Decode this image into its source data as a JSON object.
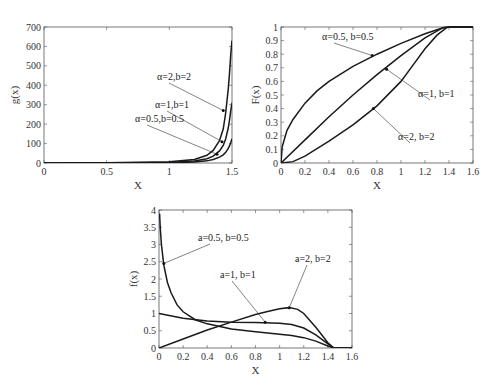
{
  "chart_data": [
    {
      "id": "g",
      "type": "line",
      "title": "",
      "xlabel": "X",
      "ylabel": "g(x)",
      "xlim": [
        0,
        1.5
      ],
      "ylim": [
        0,
        700
      ],
      "xticks": [
        0,
        0.5,
        1,
        1.5
      ],
      "xtick_labels": [
        "0",
        "0.5",
        "1",
        "1.5"
      ],
      "yticks": [
        0,
        100,
        200,
        300,
        400,
        500,
        600,
        700
      ],
      "ytick_labels": [
        "0",
        "100",
        "200",
        "300",
        "400",
        "500",
        "600",
        "700"
      ],
      "grid": false,
      "box": {
        "left": 44,
        "top": 27,
        "right": 232,
        "bottom": 163
      },
      "series": [
        {
          "name": "α=2,b=2",
          "x": [
            0,
            0.5,
            1.0,
            1.2,
            1.3,
            1.35,
            1.4,
            1.43,
            1.45,
            1.47,
            1.48,
            1.49,
            1.5
          ],
          "y": [
            0,
            1,
            6,
            18,
            40,
            65,
            115,
            175,
            260,
            380,
            460,
            560,
            630
          ]
        },
        {
          "name": "α=1,b=1",
          "x": [
            0,
            0.5,
            1.0,
            1.2,
            1.3,
            1.35,
            1.4,
            1.43,
            1.45,
            1.47,
            1.48,
            1.49,
            1.5
          ],
          "y": [
            0,
            0.5,
            3,
            10,
            22,
            35,
            62,
            90,
            125,
            180,
            220,
            270,
            310
          ]
        },
        {
          "name": "α=0.5,b=0.5",
          "x": [
            0,
            0.5,
            1.0,
            1.2,
            1.3,
            1.35,
            1.4,
            1.43,
            1.45,
            1.47,
            1.48,
            1.49,
            1.5
          ],
          "y": [
            0,
            0.2,
            1.5,
            5,
            11,
            18,
            30,
            42,
            55,
            75,
            88,
            105,
            125
          ]
        }
      ],
      "annotations": [
        {
          "text": "α=2,b=2",
          "x": 1.43,
          "y": 270,
          "tx": 157,
          "ty": 80
        },
        {
          "text": "α=1,b=1",
          "x": 1.42,
          "y": 110,
          "tx": 155,
          "ty": 108
        },
        {
          "text": "α=0.5,b=0.5",
          "x": 1.38,
          "y": 45,
          "tx": 135,
          "ty": 122
        }
      ]
    },
    {
      "id": "F",
      "type": "line",
      "title": "",
      "xlabel": "X",
      "ylabel": "F(x)",
      "xlim": [
        0,
        1.6
      ],
      "ylim": [
        0,
        1
      ],
      "xticks": [
        0,
        0.2,
        0.4,
        0.6,
        0.8,
        1,
        1.2,
        1.4,
        1.6
      ],
      "xtick_labels": [
        "0",
        "0.2",
        "0.4",
        "0.6",
        "0.8",
        "1",
        "1.2",
        "1.4",
        "1.6"
      ],
      "yticks": [
        0,
        0.1,
        0.2,
        0.3,
        0.4,
        0.5,
        0.6,
        0.7,
        0.8,
        0.9,
        1
      ],
      "ytick_labels": [
        "0",
        "0.1",
        "0.2",
        "0.3",
        "0.4",
        "0.5",
        "0.6",
        "0.7",
        "0.8",
        "0.9",
        "1"
      ],
      "grid": false,
      "box": {
        "left": 281,
        "top": 27,
        "right": 473,
        "bottom": 163
      },
      "series": [
        {
          "name": "α=0.5, b=0.5",
          "x": [
            0,
            0.01,
            0.05,
            0.1,
            0.2,
            0.3,
            0.4,
            0.6,
            0.8,
            1.0,
            1.2,
            1.35,
            1.4,
            1.6
          ],
          "y": [
            0,
            0.12,
            0.24,
            0.32,
            0.44,
            0.53,
            0.6,
            0.71,
            0.8,
            0.88,
            0.95,
            0.995,
            1,
            1
          ]
        },
        {
          "name": "α=1, b=1",
          "x": [
            0,
            0.2,
            0.4,
            0.6,
            0.8,
            1.0,
            1.2,
            1.35,
            1.4,
            1.6
          ],
          "y": [
            0,
            0.17,
            0.34,
            0.5,
            0.65,
            0.79,
            0.92,
            0.995,
            1,
            1
          ]
        },
        {
          "name": "α=2, b=2",
          "x": [
            0,
            0.1,
            0.2,
            0.4,
            0.6,
            0.8,
            1.0,
            1.1,
            1.2,
            1.3,
            1.38,
            1.4,
            1.6
          ],
          "y": [
            0,
            0.01,
            0.05,
            0.16,
            0.28,
            0.42,
            0.6,
            0.72,
            0.84,
            0.94,
            0.995,
            1,
            1
          ]
        }
      ],
      "annotations": [
        {
          "text": "α=0.5, b=0.5",
          "x": 0.76,
          "y": 0.79,
          "tx": 322,
          "ty": 40
        },
        {
          "text": "α=1, b=1",
          "x": 0.88,
          "y": 0.69,
          "tx": 418,
          "ty": 97
        },
        {
          "text": "α=2, b=2",
          "x": 0.77,
          "y": 0.4,
          "tx": 398,
          "ty": 140
        }
      ]
    },
    {
      "id": "f",
      "type": "line",
      "title": "",
      "xlabel": "X",
      "ylabel": "f(x)",
      "xlim": [
        0,
        1.6
      ],
      "ylim": [
        0,
        4
      ],
      "xticks": [
        0,
        0.2,
        0.4,
        0.6,
        0.8,
        1,
        1.2,
        1.4,
        1.6
      ],
      "xtick_labels": [
        "0",
        "0.2",
        "0.4",
        "0.6",
        "0.8",
        "1",
        "1.2",
        "1.4",
        "1.6"
      ],
      "yticks": [
        0,
        0.5,
        1,
        1.5,
        2,
        2.5,
        3,
        3.5,
        4
      ],
      "ytick_labels": [
        "0",
        "0.5",
        "1",
        "1.5",
        "2",
        "2.5",
        "3",
        "3.5",
        "4"
      ],
      "grid": false,
      "box": {
        "left": 159,
        "top": 210,
        "right": 352,
        "bottom": 348
      },
      "series": [
        {
          "name": "a=0.5, b=0.5",
          "x": [
            0.005,
            0.01,
            0.02,
            0.04,
            0.07,
            0.1,
            0.15,
            0.2,
            0.3,
            0.4,
            0.6,
            0.8,
            1.0,
            1.1,
            1.2,
            1.3,
            1.4,
            1.45,
            1.6
          ],
          "y": [
            3.9,
            3.5,
            3.0,
            2.4,
            1.9,
            1.6,
            1.25,
            1.05,
            0.82,
            0.7,
            0.55,
            0.47,
            0.4,
            0.36,
            0.3,
            0.2,
            0.06,
            0,
            0
          ]
        },
        {
          "name": "a=1, b=1",
          "x": [
            0,
            0.2,
            0.4,
            0.6,
            0.8,
            1.0,
            1.1,
            1.2,
            1.3,
            1.4,
            1.45,
            1.6
          ],
          "y": [
            1.0,
            0.86,
            0.78,
            0.75,
            0.74,
            0.72,
            0.68,
            0.58,
            0.38,
            0.12,
            0,
            0
          ]
        },
        {
          "name": "a=2, b=2",
          "x": [
            0,
            0.2,
            0.4,
            0.6,
            0.8,
            0.9,
            1.0,
            1.08,
            1.15,
            1.2,
            1.3,
            1.4,
            1.45,
            1.6
          ],
          "y": [
            0,
            0.26,
            0.52,
            0.75,
            0.97,
            1.06,
            1.14,
            1.17,
            1.12,
            1.0,
            0.6,
            0.15,
            0,
            0
          ]
        }
      ],
      "annotations": [
        {
          "text": "a=0.5, b=0.5",
          "x": 0.04,
          "y": 2.45,
          "tx": 198,
          "ty": 241
        },
        {
          "text": "a=1, b=1",
          "x": 0.88,
          "y": 0.75,
          "tx": 220,
          "ty": 278
        },
        {
          "text": "a=2, b=2",
          "x": 1.08,
          "y": 1.17,
          "tx": 295,
          "ty": 262
        }
      ]
    }
  ]
}
